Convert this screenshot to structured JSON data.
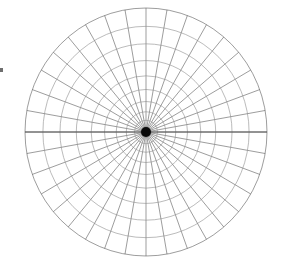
{
  "figure": {
    "type": "polar-grid-diagram",
    "width": 290,
    "height": 272,
    "background_color": "#ffffff"
  },
  "chart_data": {
    "type": "scatter",
    "title": "",
    "subtitle": "",
    "xlabel": "",
    "ylabel": "",
    "grid": true,
    "legend": null,
    "projection": "polar",
    "center": {
      "cx": 146,
      "cy": 132
    },
    "outer_radius_x": 121,
    "outer_radius_y": 124,
    "ring_count": 10,
    "spoke_count": 36,
    "spoke_angle_step_deg": 10,
    "ring_radii_fraction": [
      0.042,
      0.095,
      0.163,
      0.246,
      0.343,
      0.453,
      0.576,
      0.711,
      0.852,
      1.0
    ],
    "spoke_angles_deg": [
      0,
      10,
      20,
      30,
      40,
      50,
      60,
      70,
      80,
      90,
      100,
      110,
      120,
      130,
      140,
      150,
      160,
      170,
      180,
      190,
      200,
      210,
      220,
      230,
      240,
      250,
      260,
      270,
      280,
      290,
      300,
      310,
      320,
      330,
      340,
      350
    ],
    "axis_line_angles_deg": [
      0,
      180
    ],
    "xlim": [
      -1,
      1
    ],
    "ylim": [
      -1,
      1
    ]
  },
  "style": {
    "line_color": "#5a5a5a",
    "line_color_faint": "#8d8d8d",
    "axis_line_color": "#4a4a4a",
    "hub_color": "#0a0a0a",
    "line_width": 0.6,
    "axis_line_width": 0.9,
    "hub_radius": 5
  },
  "artifacts": {
    "edge_mark": {
      "name": "left-edge-tick",
      "x": 0,
      "y": 68,
      "width": 3,
      "height": 4,
      "color": "#6e6e6e"
    }
  }
}
